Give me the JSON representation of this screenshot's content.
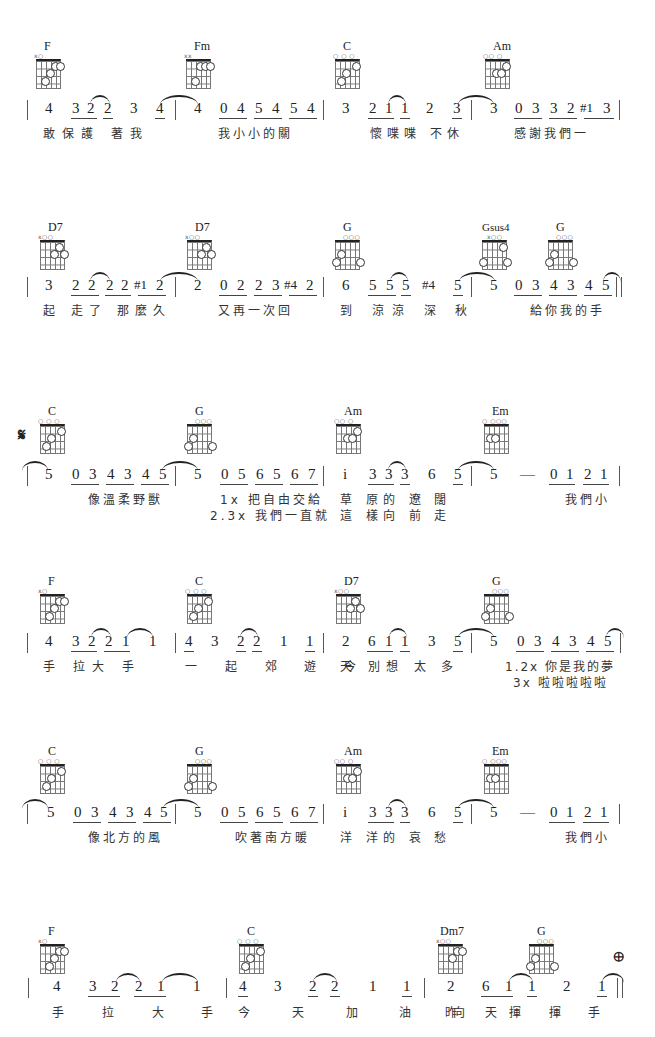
{
  "sheet": {
    "lines": [
      {
        "chords": [
          {
            "name": "F",
            "marks": "x○",
            "x": 28,
            "dots": [
              {
                "s": 4,
                "f": 1,
                "l": "①"
              },
              {
                "s": 5,
                "f": 1,
                "l": "①"
              },
              {
                "s": 3,
                "f": 2,
                "l": "②"
              },
              {
                "s": 2,
                "f": 3,
                "l": "③"
              }
            ]
          },
          {
            "name": "Fm",
            "marks": "xx",
            "x": 185,
            "dots": [
              {
                "s": 3,
                "f": 1,
                "l": "①"
              },
              {
                "s": 4,
                "f": 1,
                "l": "①"
              },
              {
                "s": 5,
                "f": 1,
                "l": "①"
              },
              {
                "s": 2,
                "f": 3,
                "l": "③"
              }
            ]
          },
          {
            "name": "C",
            "marks": "○  ○ ○",
            "x": 335,
            "dots": [
              {
                "s": 4,
                "f": 1,
                "l": "①"
              },
              {
                "s": 2,
                "f": 2,
                "l": "②"
              },
              {
                "s": 1,
                "f": 3,
                "l": "③"
              }
            ]
          },
          {
            "name": "Am",
            "marks": "○○   ○",
            "x": 485,
            "dots": [
              {
                "s": 4,
                "f": 1,
                "l": "①"
              },
              {
                "s": 2,
                "f": 2,
                "l": "②"
              },
              {
                "s": 3,
                "f": 2,
                "l": "③"
              }
            ]
          }
        ],
        "notation": "| 4  3 2 2  3  4 | 4  0 4 5 4 5 4 | 3  2 1 1  2  3 | 3  0 3 3 2 #1 3 |",
        "measures": [
          [
            "4",
            "3",
            "2",
            "2",
            "3",
            "4"
          ],
          [
            "4",
            "0",
            "4",
            "5",
            "4",
            "5",
            "4"
          ],
          [
            "3",
            "2",
            "1",
            "1",
            "2",
            "3"
          ],
          [
            "3",
            "0",
            "3",
            "3",
            "2",
            "#1",
            "3"
          ]
        ],
        "lyrics": [
          "敢保護 著我",
          "我小小的關",
          "懷喋喋 不休",
          "感謝我們一"
        ]
      },
      {
        "chords": [
          {
            "name": "D7",
            "marks": "x○○",
            "x": 28
          },
          {
            "name": "D7",
            "marks": "x○○",
            "x": 185
          },
          {
            "name": "G",
            "marks": "○○○",
            "x": 335
          },
          {
            "name": "Gsus4",
            "marks": "x○○",
            "x": 480
          },
          {
            "name": "G",
            "marks": "○○○",
            "x": 548
          }
        ],
        "measures": [
          [
            "3",
            "2",
            "2",
            "2",
            "2",
            "#1",
            "2"
          ],
          [
            "2",
            "0",
            "2",
            "2",
            "3",
            "#4",
            "2"
          ],
          [
            "6",
            "5",
            "5",
            "5",
            "#4",
            "5"
          ],
          [
            "5",
            "0",
            "3",
            "4",
            "3",
            "4",
            "5"
          ]
        ],
        "lyrics": [
          "起 走了 那麼久",
          "又再一次回",
          "到 涼涼 深 秋",
          "給你我的手"
        ]
      },
      {
        "segno": "𝄋",
        "chords": [
          {
            "name": "C",
            "marks": "○  ○ ○",
            "x": 40
          },
          {
            "name": "G",
            "marks": "○○○",
            "x": 185
          },
          {
            "name": "Am",
            "marks": "○○   ○",
            "x": 335
          },
          {
            "name": "Em",
            "marks": "○  ○○○",
            "x": 485
          }
        ],
        "measures": [
          [
            "5",
            "0",
            "3",
            "4",
            "3",
            "4",
            "5"
          ],
          [
            "5",
            "0",
            "5",
            "6",
            "5",
            "6",
            "7"
          ],
          [
            "i",
            "3",
            "3",
            "3",
            "6",
            "5"
          ],
          [
            "5",
            "—",
            "0",
            "1",
            "2",
            "1"
          ]
        ],
        "lyrics": [
          "像溫柔野獸",
          "1x 把自由交給",
          "草 原的 遼 闊",
          "我們小"
        ],
        "lyrics2": [
          "",
          "2.3x 我們一直就",
          "這 樣向 前 走",
          ""
        ]
      },
      {
        "chords": [
          {
            "name": "F",
            "marks": "x○",
            "x": 40
          },
          {
            "name": "C",
            "marks": "○  ○ ○",
            "x": 185
          },
          {
            "name": "D7",
            "marks": "x○○",
            "x": 335
          },
          {
            "name": "G",
            "marks": "○○○",
            "x": 485
          }
        ],
        "measures": [
          [
            "4",
            "3",
            "2",
            "2",
            "1",
            "1"
          ],
          [
            "4",
            "3",
            "2",
            "2",
            "1",
            "1"
          ],
          [
            "2",
            "6",
            "1",
            "1",
            "3",
            "5"
          ],
          [
            "5",
            "0",
            "3",
            "4",
            "3",
            "4",
            "5"
          ]
        ],
        "lyrics": [
          "手 拉大 手",
          "一 起 郊 遊 今",
          "天 別想 太 多",
          "1.2x 你是我的夢"
        ],
        "lyrics2": [
          "",
          "",
          "",
          "3x 啦啦啦啦啦"
        ]
      },
      {
        "chords": [
          {
            "name": "C",
            "marks": "○  ○ ○",
            "x": 40
          },
          {
            "name": "G",
            "marks": "○○○",
            "x": 185
          },
          {
            "name": "Am",
            "marks": "○○   ○",
            "x": 335
          },
          {
            "name": "Em",
            "marks": "○  ○○○",
            "x": 485
          }
        ],
        "measures": [
          [
            "5",
            "0",
            "3",
            "4",
            "3",
            "4",
            "5"
          ],
          [
            "5",
            "0",
            "5",
            "6",
            "5",
            "6",
            "7"
          ],
          [
            "i",
            "3",
            "3",
            "3",
            "6",
            "5"
          ],
          [
            "5",
            "—",
            "0",
            "1",
            "2",
            "1"
          ]
        ],
        "lyrics": [
          "像北方的風",
          "吹著南方暖",
          "洋 洋的 哀 愁",
          "我們小"
        ]
      },
      {
        "coda": "⊕",
        "chords": [
          {
            "name": "F",
            "marks": "x○",
            "x": 40
          },
          {
            "name": "C",
            "marks": "○  ○ ○",
            "x": 238
          },
          {
            "name": "Dm7",
            "marks": "x○○",
            "x": 438
          },
          {
            "name": "G",
            "marks": "○○○",
            "x": 528
          }
        ],
        "measures": [
          [
            "4",
            "3",
            "2",
            "2",
            "1",
            "1"
          ],
          [
            "4",
            "3",
            "2",
            "2",
            "1",
            "1"
          ],
          [
            "2",
            "6",
            "1",
            "1",
            "2",
            "1"
          ]
        ],
        "lyrics": [
          "手 拉 大 手",
          "今 天 加 油 向",
          "昨 天揮 揮 手"
        ]
      }
    ]
  }
}
